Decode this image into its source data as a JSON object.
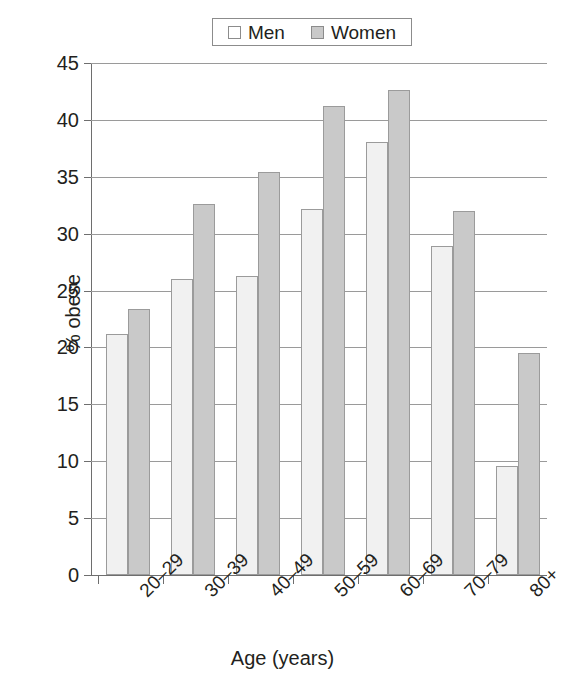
{
  "chart_data": {
    "type": "bar",
    "title": "",
    "xlabel": "Age (years)",
    "ylabel": "% obese",
    "categories": [
      "20–29",
      "30–39",
      "40–49",
      "50–59",
      "60–69",
      "70–79",
      "80+"
    ],
    "series": [
      {
        "name": "Men",
        "color": "#f1f1f1",
        "values": [
          21.2,
          26.0,
          26.3,
          32.2,
          38.1,
          28.9,
          9.6
        ]
      },
      {
        "name": "Women",
        "color": "#c9c9c9",
        "values": [
          23.4,
          32.6,
          35.4,
          41.2,
          42.6,
          32.0,
          19.5
        ]
      }
    ],
    "ylim": [
      0,
      45
    ],
    "ytick_values": [
      0,
      5,
      10,
      15,
      20,
      25,
      30,
      35,
      40,
      45
    ],
    "ytick_labels": [
      "0",
      "5",
      "10",
      "15",
      "20",
      "25",
      "30",
      "35",
      "40",
      "45"
    ],
    "grid": "horizontal",
    "legend_position": "top-center",
    "legend_entries": [
      "Men",
      "Women"
    ],
    "bar_border_color": "#9b9b9b",
    "axis_color": "#6e6e6e",
    "gridline_color": "#9a9a9a"
  },
  "legend": {
    "men_label": "Men",
    "women_label": "Women"
  },
  "axes": {
    "x_title": "Age (years)",
    "y_title": "% obese"
  }
}
